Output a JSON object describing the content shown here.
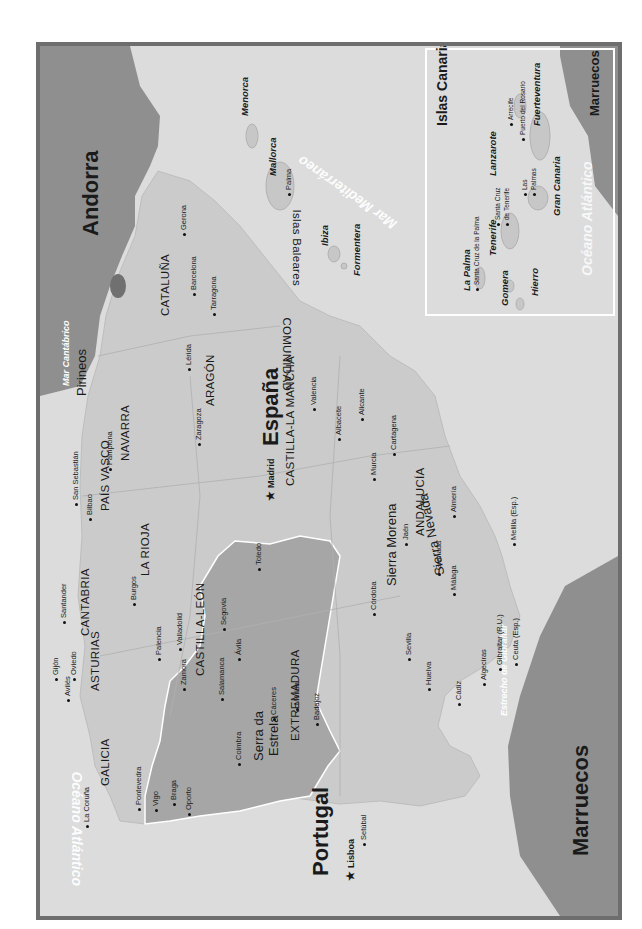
{
  "map": {
    "title": "España",
    "orientation": "rotated 90° (text reads bottom-to-top)",
    "colors": {
      "frame": "#6e6e6e",
      "sea": "#dcdcdc",
      "spain_land": "#cbcbcb",
      "portugal_land": "#a6a6a6",
      "neighbor_land": "#8f8f8f",
      "andorra": "#707070",
      "inset_border": "#ffffff"
    },
    "countries": {
      "spain": "España",
      "portugal": "Portugal",
      "andorra": "Andorra",
      "marruecos_main": "Marruecos",
      "marruecos_inset": "Marruecos"
    },
    "capitals": {
      "madrid": "Madrid",
      "lisboa": "Lisboa"
    },
    "seas": {
      "cantabrico": "Mar Cantábrico",
      "atlantico_left": "Océano Atlántico",
      "mediterraneo": "Mar Mediterráneo",
      "gibraltar": "Estrecho de Gibraltar",
      "atlantico_inset": "Océano Atlántico"
    },
    "regions": {
      "galicia": "GALICIA",
      "asturias": "ASTURIAS",
      "cantabria": "CANTABRIA",
      "pais_vasco": "PAÍS VASCO",
      "navarra": "NAVARRA",
      "la_rioja": "LA RIOJA",
      "aragon": "ARAGÓN",
      "cataluna": "CATALUÑA",
      "castilla_leon": "CASTILLA-LEÓN",
      "castilla_la_mancha": "CASTILLA-LA MANCHA",
      "extremadura": "EXTREMADURA",
      "andalucia": "ANDALUCÍA",
      "comunidad_valenciana_1": "COMUNIDAD",
      "comunidad_valenciana_2": "VALENCIANA"
    },
    "mountains": {
      "pirineos": "Pirineos",
      "sierra_morena": "Sierra Morena",
      "sierra_nevada": "Sierra Nevada",
      "serra_estrela_1": "Serra da",
      "serra_estrela_2": "Estrela"
    },
    "cities": {
      "la_coruna": "La Coruña",
      "pontevedra": "Pontevedra",
      "vigo": "Vigo",
      "aviles": "Avilés",
      "gijon": "Gijón",
      "oviedo": "Oviedo",
      "santander": "Santander",
      "bilbao": "Bilbao",
      "san_sebastian": "San Sebastián",
      "pamplona": "Pamplona",
      "burgos": "Burgos",
      "palencia": "Palencia",
      "valladolid": "Valladolid",
      "zamora": "Zamora",
      "salamanca": "Salamanca",
      "avila": "Ávila",
      "segovia": "Segovia",
      "zaragoza": "Zaragoza",
      "lerida": "Lérida",
      "gerona": "Gerona",
      "barcelona": "Barcelona",
      "tarragona": "Tarragona",
      "valencia": "Valencia",
      "alicante": "Alicante",
      "albacete": "Albacete",
      "murcia": "Murcia",
      "cartagena": "Cartagena",
      "toledo": "Toledo",
      "caceres": "Cáceres",
      "merida": "Mérida",
      "badajoz": "Badajoz",
      "cordoba": "Córdoba",
      "jaen": "Jaén",
      "granada": "Granada",
      "almeria": "Almería",
      "malaga": "Málaga",
      "sevilla": "Sevilla",
      "huelva": "Huelva",
      "cadiz": "Cádiz",
      "algeciras": "Algeciras",
      "gibraltar": "Gibraltar (R.U.)",
      "ceuta": "Ceuta (Esp.)",
      "melilla": "Melilla (Esp.)",
      "oporto": "Oporto",
      "braga": "Braga",
      "coimbra": "Coimbra",
      "setubal": "Setúbal",
      "palma": "Palma"
    },
    "baleares": {
      "group": "Islas Baleares",
      "menorca": "Menorca",
      "mallorca": "Mallorca",
      "ibiza": "Ibiza",
      "formentera": "Formentera"
    },
    "canarias_inset": {
      "title": "Islas Canarias",
      "islands": {
        "la_palma": "La Palma",
        "tenerife": "Tenerife",
        "gomera": "Gomera",
        "hierro": "Hierro",
        "gran_canaria": "Gran Canaria",
        "lanzarote": "Lanzarote",
        "fuerteventura": "Fuerteventura"
      },
      "cities": {
        "santa_cruz_la_palma": "Santa Cruz de la Palma",
        "santa_cruz_tenerife_1": "Santa Cruz",
        "santa_cruz_tenerife_2": "de Tenerife",
        "las_palmas_1": "Las",
        "las_palmas_2": "Palmas",
        "arrecife": "Arrecife",
        "puerto_del_rosario": "Puerto del Rosario"
      }
    }
  }
}
